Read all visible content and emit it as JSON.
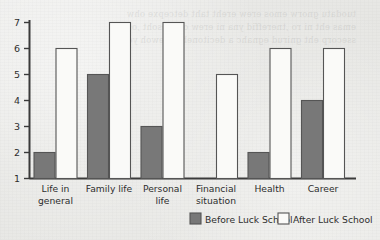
{
  "chart_data": {
    "type": "bar",
    "title": "",
    "subtitle": "",
    "xlabel": "",
    "ylabel": "",
    "categories": [
      "Life in general",
      "Family life",
      "Personal life",
      "Financial situation",
      "Health",
      "Career"
    ],
    "category_lines": [
      [
        "Life in",
        "general"
      ],
      [
        "Family life",
        ""
      ],
      [
        "Personal",
        "life"
      ],
      [
        "Financial",
        "situation"
      ],
      [
        "Health",
        ""
      ],
      [
        "Career",
        ""
      ]
    ],
    "series": [
      {
        "name": "Before Luck School",
        "values": [
          2,
          5,
          3,
          1,
          2,
          4
        ],
        "color": "#787878"
      },
      {
        "name": "After Luck School",
        "values": [
          6,
          7,
          7,
          5,
          6,
          6
        ],
        "color": "#fafaf8"
      }
    ],
    "ylim": [
      1,
      7
    ],
    "yticks": [
      1,
      2,
      3,
      4,
      5,
      6,
      7
    ],
    "ytick_labels": [
      "1",
      "2",
      "3",
      "4",
      "5",
      "6",
      "7"
    ],
    "grid": false,
    "legend_position": "bottom-right",
    "axis_color": "#3a3a3a",
    "bar_edge_color": "#555555",
    "text_color": "#2e2e2e",
    "background_color": "#e9e9e6"
  },
  "legend": {
    "entries": [
      {
        "label": "Before Luck School",
        "swatch": "filled"
      },
      {
        "label": "After Luck School",
        "swatch": "outline"
      }
    ]
  },
  "bleed_through": {
    "text": "tuodatu gnorw emos erew ereht taht detcepxe ohw\nemas eht ni ro ,tnereffid yna ni erew ohw esoht ,os\nssecorp eht gnirud egnahc a decitoneb revewoh yeht"
  }
}
